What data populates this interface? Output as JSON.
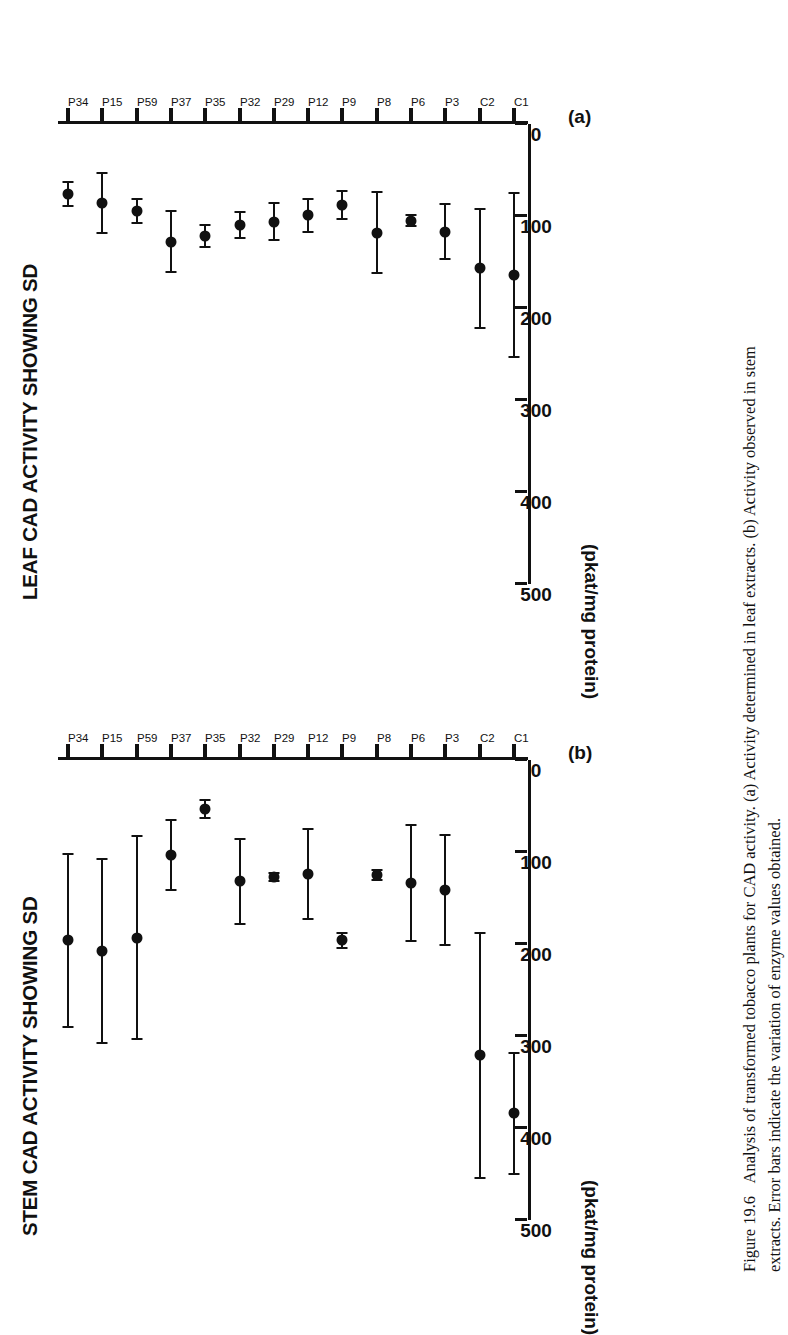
{
  "figure": {
    "number_label": "Figure 19.6",
    "caption_line1": "Analysis of transformed tobacco plants for CAD activity. (a) Activity determined in leaf extracts. (b) Activity observed in stem",
    "caption_line2": "extracts. Error bars indicate the variation of enzyme values obtained."
  },
  "panels": [
    {
      "tag": "(a)",
      "title": "LEAF CAD ACTIVITY SHOWING SD",
      "axis_unit": "(pkat/mg protein)"
    },
    {
      "tag": "(b)",
      "title": "STEM CAD ACTIVITY SHOWING SD",
      "axis_unit": "(pkat/mg protein)"
    }
  ],
  "axis": {
    "value_ticks": [
      "0",
      "100",
      "200",
      "300",
      "400",
      "500"
    ],
    "categories": [
      "C1",
      "C2",
      "P3",
      "P6",
      "P8",
      "P9",
      "P12",
      "P29",
      "P32",
      "P35",
      "P37",
      "P59",
      "P15",
      "P34"
    ]
  },
  "chart_data": [
    {
      "id": "a",
      "type": "scatter",
      "title": "LEAF CAD ACTIVITY SHOWING SD",
      "panel_tag": "(a)",
      "orientation": "horizontal-categories",
      "xlabel": "",
      "ylabel": "(pkat/mg protein)",
      "ylim": [
        0,
        500
      ],
      "yticks": [
        0,
        100,
        200,
        300,
        400,
        500
      ],
      "grid": false,
      "legend": "none",
      "errorbar_type": "SD",
      "categories": [
        "C1",
        "C2",
        "P3",
        "P6",
        "P8",
        "P9",
        "P12",
        "P29",
        "P32",
        "P35",
        "P37",
        "P59",
        "P15",
        "P34"
      ],
      "values": [
        164,
        157,
        117,
        105,
        118,
        88,
        99,
        106,
        110,
        122,
        128,
        95,
        86,
        76
      ],
      "errors": [
        89,
        65,
        30,
        6,
        44,
        15,
        18,
        20,
        14,
        12,
        33,
        13,
        33,
        13
      ]
    },
    {
      "id": "b",
      "type": "scatter",
      "title": "STEM CAD ACTIVITY SHOWING SD",
      "panel_tag": "(b)",
      "orientation": "horizontal-categories",
      "xlabel": "",
      "ylabel": "(pkat/mg protein)",
      "ylim": [
        0,
        500
      ],
      "yticks": [
        0,
        100,
        200,
        300,
        400,
        500
      ],
      "grid": false,
      "legend": "none",
      "errorbar_type": "SD",
      "categories": [
        "C1",
        "C2",
        "P3",
        "P6",
        "P8",
        "P9",
        "P12",
        "P29",
        "P32",
        "P35",
        "P37",
        "P59",
        "P15",
        "P34"
      ],
      "values": [
        384,
        321,
        141,
        134,
        125,
        196,
        124,
        127,
        132,
        53,
        103,
        193,
        208,
        196
      ],
      "errors": [
        66,
        133,
        60,
        63,
        5,
        8,
        49,
        4,
        46,
        10,
        38,
        110,
        100,
        94
      ]
    }
  ]
}
